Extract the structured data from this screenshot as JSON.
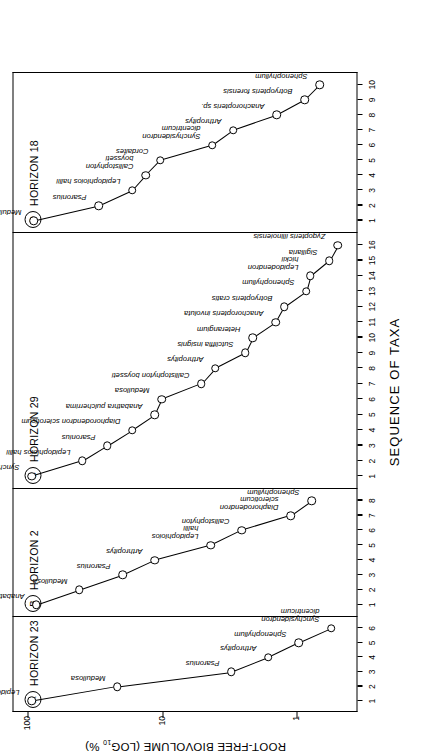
{
  "chart_data": {
    "type": "line",
    "title": "",
    "xlabel": "SEQUENCE OF TAXA",
    "ylabel": "ROOT-FREE BIOVOLUME (LOG10 %)",
    "ylabel_main": "ROOT-FREE BIOVOLUME (LOG",
    "ylabel_sub": "10",
    "ylabel_tail": " %)",
    "y_ticks": [
      "100",
      "10",
      "1"
    ],
    "y_tick_values": [
      100,
      10,
      1
    ],
    "ylim": [
      0.35,
      130
    ],
    "y_scale": "log10",
    "grid": false,
    "legend": "none",
    "panels": [
      {
        "tag": "A",
        "title": "HORIZON 23",
        "x_ticks": [
          1,
          2,
          3,
          4,
          5,
          6
        ],
        "x": [
          1,
          2,
          3,
          4,
          5,
          6
        ],
        "values": [
          95,
          22,
          3.1,
          1.65,
          0.98,
          0.56
        ],
        "labels": [
          "Lepidophloios hallii",
          "Medullosa",
          "Psaronius",
          "Arthropitys",
          "Sphenophyllum",
          "Synchysidendron\ndicentricum"
        ]
      },
      {
        "tag": "B",
        "title": "HORIZON 2",
        "x_ticks": [
          1,
          2,
          3,
          4,
          5,
          6,
          7,
          8
        ],
        "x": [
          1,
          2,
          3,
          4,
          5,
          6,
          7,
          8
        ],
        "values": [
          88,
          42,
          20,
          11.5,
          4.4,
          2.6,
          1.12,
          0.78
        ],
        "labels": [
          "Anabathra pulcherrima",
          "Medullosa",
          "Psaronius",
          "Arthropitys",
          "Lepidophloios\nhallii",
          "Callistophyton",
          "Diaphorodendron\nscleroticum",
          "Sphenophyllum"
        ]
      },
      {
        "tag": "C",
        "title": "HORIZON 29",
        "x_ticks": [
          1,
          2,
          3,
          4,
          5,
          6,
          7,
          8,
          9,
          10,
          11,
          12,
          13,
          14,
          15,
          16
        ],
        "x": [
          1,
          2,
          3,
          4,
          5,
          6,
          7,
          8,
          9,
          10,
          11,
          12,
          13,
          14,
          15,
          16
        ],
        "values": [
          95,
          40,
          26,
          17,
          11.5,
          10.2,
          5.2,
          4.1,
          2.45,
          2.15,
          1.45,
          1.25,
          0.86,
          0.8,
          0.58,
          0.5
        ],
        "labels": [
          "Synchysidendron dicentricum",
          "Lepidophloios hallii",
          "Psaronius",
          "Diaphorodendron scleroticum",
          "Anabathra pulcherrima",
          "Medullosa",
          "Callistophyton boysseti",
          "Arthropitys",
          "Sutcliffia insignis",
          "Heterangium",
          "Anachoropteris involuta",
          "Botryopteris cratis",
          "Sphenophyllum",
          "Lepidodendron\nhickii",
          "Sigillaria",
          "Zygopteris illinoiensis"
        ]
      },
      {
        "tag": "D",
        "title": "HORIZON 18",
        "x_ticks": [
          1,
          2,
          3,
          4,
          5,
          6,
          7,
          8,
          9,
          10
        ],
        "x": [
          1,
          2,
          3,
          4,
          5,
          6,
          7,
          8,
          9,
          10
        ],
        "values": [
          92,
          30,
          17,
          13.5,
          10.5,
          4.3,
          3.0,
          1.42,
          0.88,
          0.68
        ],
        "labels": [
          "Medullosa",
          "Psaronius",
          "Lepidophloios hallii",
          "Callistophyton\nboysseti",
          "Cordaites",
          "Synchysidendron\ndicentricum",
          "Arthropitys",
          "Anachoropteris sp.",
          "Botryopteris forensis",
          "Sphenophyllum"
        ]
      }
    ]
  }
}
